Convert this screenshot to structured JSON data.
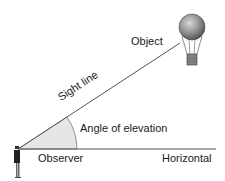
{
  "diagram": {
    "labels": {
      "object": "Object",
      "sight_line": "Sight line",
      "angle": "Angle of elevation",
      "observer": "Observer",
      "horizontal": "Horizontal"
    },
    "colors": {
      "line": "#555555",
      "angle_fill": "#e6e6e6",
      "balloon": "#7a7a7a"
    }
  }
}
